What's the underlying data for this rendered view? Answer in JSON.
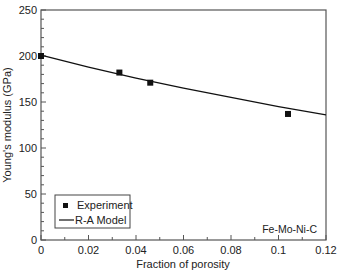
{
  "chart_data": {
    "type": "scatter",
    "title": "",
    "xlabel": "Fraction of porosity",
    "ylabel": "Young's modulus (GPa)",
    "xlim": [
      0,
      0.12
    ],
    "ylim": [
      0,
      250
    ],
    "x_ticks": [
      "0",
      "0.02",
      "0.04",
      "0.06",
      "0.08",
      "0.1",
      "0.12"
    ],
    "y_ticks": [
      "0",
      "50",
      "100",
      "150",
      "200",
      "250"
    ],
    "grid": false,
    "legend_position": "lower left",
    "annotation": "Fe-Mo-Ni-C",
    "series": [
      {
        "name": "Experiment",
        "kind": "scatter",
        "marker": "filled-square",
        "x": [
          0,
          0.033,
          0.046,
          0.104
        ],
        "y": [
          200,
          182,
          171,
          137
        ]
      },
      {
        "name": "R-A Model",
        "kind": "line",
        "x": [
          0,
          0.02,
          0.04,
          0.06,
          0.08,
          0.1,
          0.12
        ],
        "y": [
          201,
          188,
          176,
          165,
          155,
          145,
          136
        ]
      }
    ]
  },
  "legend": {
    "experiment_label": "Experiment",
    "model_label": "R-A Model"
  },
  "labels": {
    "xlabel": "Fraction of porosity",
    "ylabel": "Young's modulus (GPa)",
    "annotation": "Fe-Mo-Ni-C"
  }
}
